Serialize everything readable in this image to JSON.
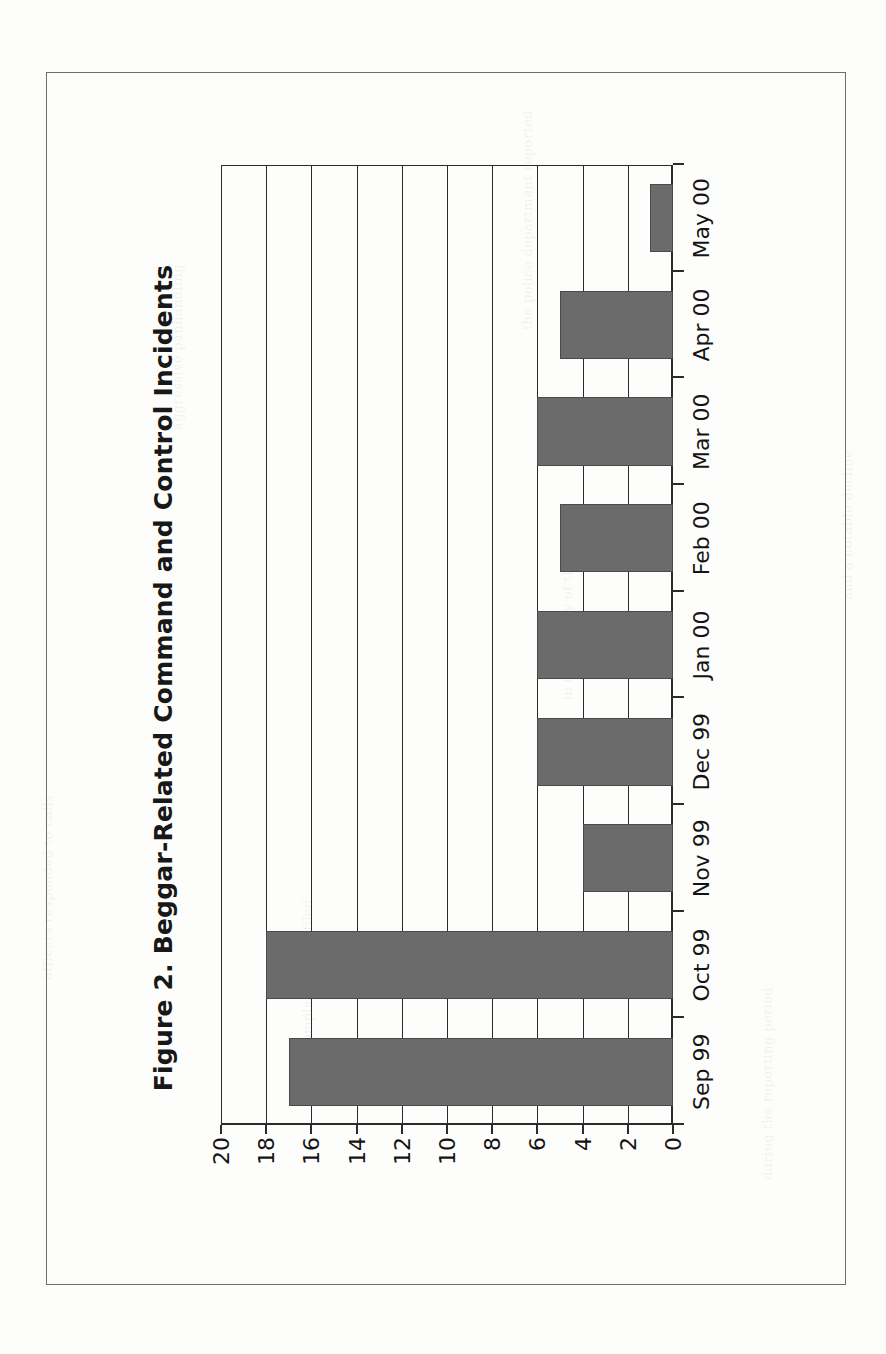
{
  "figure": {
    "frame_visible": true,
    "scan_background": "#fdfdfc",
    "orientation_note": "rotated-90-ccw"
  },
  "chart_data": {
    "type": "bar",
    "title": "Figure 2. Beggar-Related Command and Control Incidents",
    "subtitle": "",
    "xlabel": "",
    "ylabel": "",
    "categories": [
      "Sep 99",
      "Oct 99",
      "Nov 99",
      "Dec 99",
      "Jan 00",
      "Feb 00",
      "Mar 00",
      "Apr 00",
      "May 00"
    ],
    "values": [
      17,
      18,
      4,
      6,
      6,
      5,
      6,
      5,
      1
    ],
    "ylim": [
      0,
      20
    ],
    "ytick_labels": [
      "0",
      "2",
      "4",
      "6",
      "8",
      "10",
      "12",
      "14",
      "16",
      "18",
      "20"
    ],
    "ytick_values": [
      0,
      2,
      4,
      6,
      8,
      10,
      12,
      14,
      16,
      18,
      20
    ],
    "grid": true,
    "grid_axis": "y",
    "legend": false,
    "legend_position": "none",
    "bar_color": "#6b6b6b",
    "bar_edge_color": "#4a4a4a",
    "axis_color": "#2b2b2b",
    "text_color": "#141414"
  },
  "scan_artifacts": {
    "ghost_lines": [
      "the police department reported",
      "in the vicinity of the transit",
      "complaints were filed",
      "during the reporting period",
      "and a notable decline",
      "officers responded to calls",
      "aggressive panhandling"
    ]
  }
}
